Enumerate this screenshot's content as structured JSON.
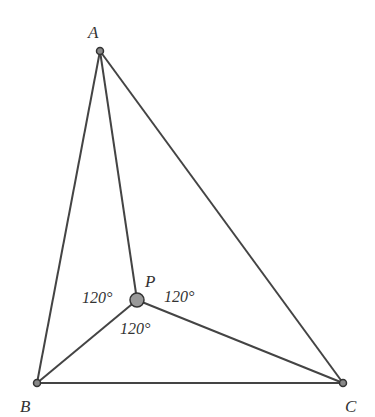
{
  "diagram": {
    "type": "geometry",
    "points": {
      "A": {
        "label": "A",
        "x": 100,
        "y": 51
      },
      "B": {
        "label": "B",
        "x": 37,
        "y": 383
      },
      "C": {
        "label": "C",
        "x": 343,
        "y": 383
      },
      "P": {
        "label": "P",
        "x": 137,
        "y": 300
      }
    },
    "segments": [
      "AB",
      "BC",
      "CA",
      "PA",
      "PB",
      "PC"
    ],
    "angles": {
      "left": "120°",
      "right": "120°",
      "bottom": "120°"
    }
  }
}
